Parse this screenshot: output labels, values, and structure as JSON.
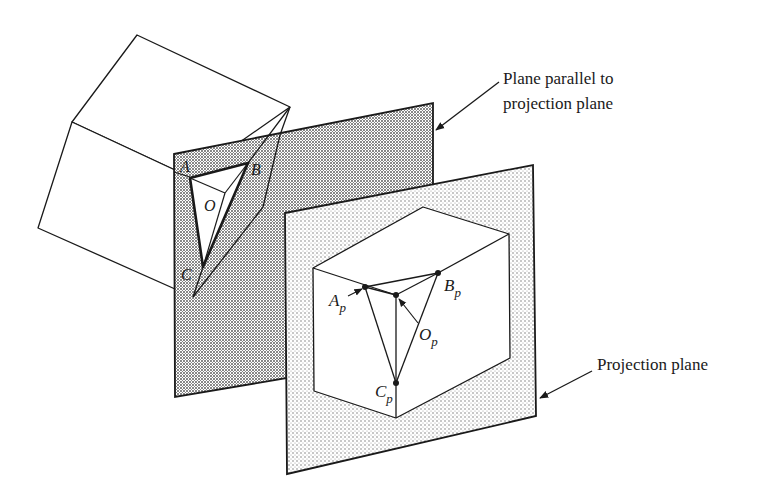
{
  "figure": {
    "labels": {
      "plane_parallel_line1": "Plane parallel to",
      "plane_parallel_line2": "projection plane",
      "projection_plane": "Projection plane"
    },
    "back_vertices": {
      "A": "A",
      "B": "B",
      "C": "C",
      "O": "O"
    },
    "projected_vertices": {
      "A": {
        "base": "A",
        "sub": "p"
      },
      "B": {
        "base": "B",
        "sub": "p"
      },
      "C": {
        "base": "C",
        "sub": "p"
      },
      "O": {
        "base": "O",
        "sub": "p"
      }
    },
    "colors": {
      "line": "#1a1a1a",
      "dark_stipple": "#8a8a8a",
      "light_stipple": "#c8c8c8",
      "background": "#ffffff"
    }
  }
}
